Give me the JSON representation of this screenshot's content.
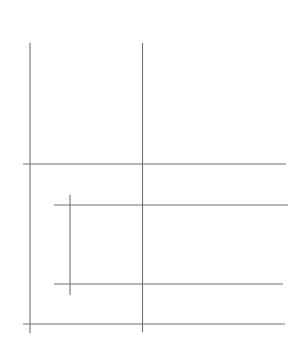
{
  "canvas": {
    "width": 306,
    "height": 339,
    "background_color": "#ffffff",
    "title": "Line Drawing"
  },
  "style": {
    "stroke_color": "#6f6f6f",
    "stroke_color_light": "#8a8a8a",
    "stroke_width": 1.1,
    "line_cap": "butt"
  },
  "figure": {
    "type": "line-drawing",
    "lines": [
      {
        "id": "vertical-left-long",
        "name": "vertical-left-long",
        "orientation": "vertical",
        "x1": 30,
        "y1": 43,
        "x2": 30,
        "y2": 333,
        "color": "#6f6f6f",
        "width": 1.1
      },
      {
        "id": "vertical-mid-long",
        "name": "vertical-mid-long",
        "orientation": "vertical",
        "x1": 142.5,
        "y1": 43,
        "x2": 142.5,
        "y2": 332,
        "color": "#6f6f6f",
        "width": 1.1
      },
      {
        "id": "vertical-inner-short",
        "name": "vertical-inner-short",
        "orientation": "vertical",
        "x1": 70,
        "y1": 195,
        "x2": 70,
        "y2": 295,
        "color": "#6f6f6f",
        "width": 1.1
      },
      {
        "id": "horizontal-upper",
        "name": "horizontal-upper",
        "orientation": "horizontal",
        "x1": 23,
        "y1": 164,
        "x2": 286,
        "y2": 164,
        "color": "#6f6f6f",
        "width": 1.1
      },
      {
        "id": "horizontal-inner-top",
        "name": "horizontal-inner-top",
        "orientation": "horizontal",
        "x1": 54,
        "y1": 205,
        "x2": 288,
        "y2": 205,
        "color": "#6f6f6f",
        "width": 1.1
      },
      {
        "id": "horizontal-inner-bottom",
        "name": "horizontal-inner-bottom",
        "orientation": "horizontal",
        "x1": 54,
        "y1": 284,
        "x2": 283,
        "y2": 284,
        "color": "#6f6f6f",
        "width": 1.1
      },
      {
        "id": "horizontal-bottom",
        "name": "horizontal-bottom",
        "orientation": "horizontal",
        "x1": 23,
        "y1": 324,
        "x2": 285,
        "y2": 324,
        "color": "#6f6f6f",
        "width": 1.1
      }
    ],
    "intersections": [
      {
        "name": "left-upper",
        "x": 30,
        "y": 164
      },
      {
        "name": "left-bottom",
        "x": 30,
        "y": 324
      },
      {
        "name": "mid-upper",
        "x": 142.5,
        "y": 164
      },
      {
        "name": "mid-inner-top",
        "x": 142.5,
        "y": 205
      },
      {
        "name": "mid-inner-bottom",
        "x": 142.5,
        "y": 284
      },
      {
        "name": "mid-bottom",
        "x": 142.5,
        "y": 324
      },
      {
        "name": "inner-top",
        "x": 70,
        "y": 205
      },
      {
        "name": "inner-bottom",
        "x": 70,
        "y": 284
      }
    ]
  }
}
